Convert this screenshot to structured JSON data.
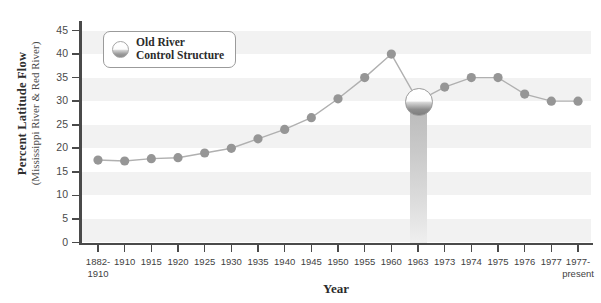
{
  "chart_data": {
    "type": "line",
    "title": "",
    "xlabel": "Year",
    "ylabel": "Percent Latitude Flow",
    "ylabel_sub": "(Mississippi River & Red River)",
    "ylim": [
      0,
      47
    ],
    "yticks": [
      0,
      5,
      10,
      15,
      20,
      25,
      30,
      35,
      40,
      45
    ],
    "grid": "alternating-horizontal-bands",
    "legend": {
      "position": "top-left-inside",
      "entries": [
        {
          "label_line1": "Old River",
          "label_line2": "Control Structure",
          "marker": "sphere-marker"
        }
      ]
    },
    "categories": [
      "1882-\n1910",
      "1910",
      "1915",
      "1920",
      "1925",
      "1930",
      "1935",
      "1940",
      "1945",
      "1950",
      "1955",
      "1960",
      "1963",
      "1973",
      "1974",
      "1975",
      "1976",
      "1977",
      "1977-\npresent"
    ],
    "category_labels": [
      {
        "line1": "1882-",
        "line2": "1910"
      },
      {
        "line1": "1910",
        "line2": ""
      },
      {
        "line1": "1915",
        "line2": ""
      },
      {
        "line1": "1920",
        "line2": ""
      },
      {
        "line1": "1925",
        "line2": ""
      },
      {
        "line1": "1930",
        "line2": ""
      },
      {
        "line1": "1935",
        "line2": ""
      },
      {
        "line1": "1940",
        "line2": ""
      },
      {
        "line1": "1945",
        "line2": ""
      },
      {
        "line1": "1950",
        "line2": ""
      },
      {
        "line1": "1955",
        "line2": ""
      },
      {
        "line1": "1960",
        "line2": ""
      },
      {
        "line1": "1963",
        "line2": ""
      },
      {
        "line1": "1973",
        "line2": ""
      },
      {
        "line1": "1974",
        "line2": ""
      },
      {
        "line1": "1975",
        "line2": ""
      },
      {
        "line1": "1976",
        "line2": ""
      },
      {
        "line1": "1977",
        "line2": ""
      },
      {
        "line1": "1977-",
        "line2": "present"
      }
    ],
    "series": [
      {
        "name": "Percent Latitude Flow",
        "values": [
          17.5,
          17.3,
          17.8,
          18.0,
          19.0,
          20.0,
          22.0,
          24.0,
          26.5,
          30.5,
          35.0,
          40.0,
          30.0,
          33.0,
          35.0,
          35.0,
          31.5,
          30.0,
          30.0
        ],
        "line_color": "#b0b0b0",
        "marker_color": "#969696"
      }
    ],
    "annotations": [
      {
        "name": "old-river-control-structure",
        "category": "1963",
        "value": 30.0,
        "description": "Old River Control Structure"
      }
    ],
    "colors": {
      "axis": "#4a4a4a",
      "band": "#f2f2f2",
      "plot_background": "#ffffff",
      "marker": "#969696",
      "line": "#b0b0b0",
      "text": "#3a3a3a"
    }
  }
}
